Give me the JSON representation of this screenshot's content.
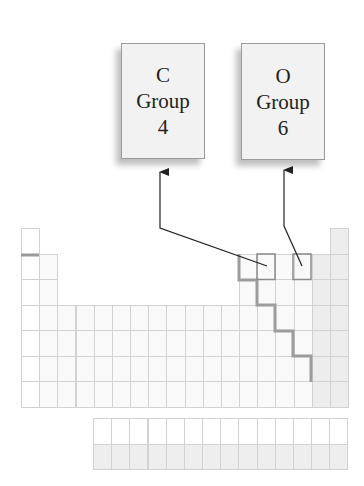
{
  "callouts": [
    {
      "element": "C",
      "group_label": "Group",
      "group_number": "4"
    },
    {
      "element": "O",
      "group_label": "Group",
      "group_number": "6"
    }
  ],
  "periodic_table": {
    "columns": 18,
    "main_rows": 7,
    "f_block_rows": 2,
    "f_block_columns": 14,
    "highlighted_cells": [
      "C",
      "O"
    ]
  },
  "colors": {
    "box_fill": "#f2f2f2",
    "grid_line": "#d2d2d2",
    "metalloid_staircase": "#999999",
    "arrow": "#222222"
  }
}
